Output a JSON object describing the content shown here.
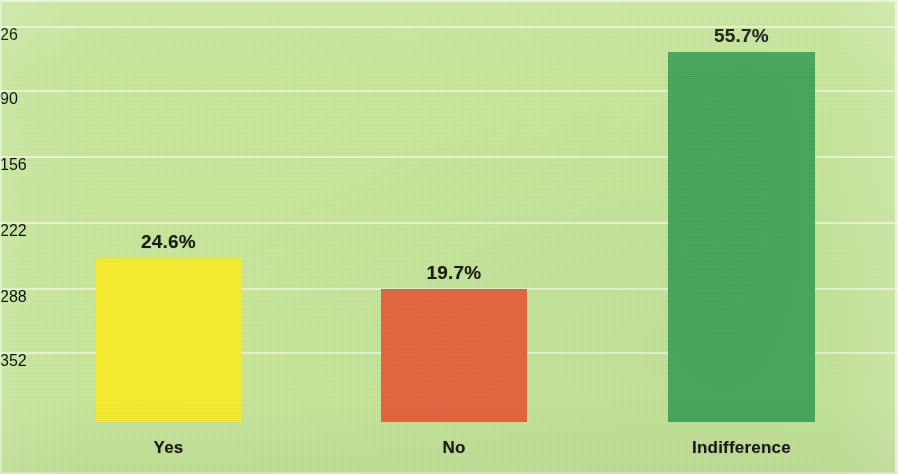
{
  "chart_data": {
    "type": "bar",
    "title": "",
    "subtitle": "",
    "xlabel": "",
    "ylabel": "",
    "categories": [
      "Yes",
      "No",
      "Indifference"
    ],
    "values": [
      24.6,
      19.7,
      55.7
    ],
    "value_labels": [
      "24.6%",
      "19.7%",
      "55.7%"
    ],
    "series": [
      {
        "name": "",
        "values": [
          24.6,
          19.7,
          55.7
        ]
      }
    ],
    "bar_colors": [
      "#f8ee2e",
      "#e8663f",
      "#48a85c"
    ],
    "ylim": [
      0,
      70
    ],
    "grid": true,
    "gridlines_horizontal": 6,
    "legend": "none",
    "legend_position": "none",
    "background_color": "#c8e89c",
    "label_color": "#1a1a16",
    "units": "percent"
  },
  "bars": [
    {
      "category": "Yes",
      "value_label": "24.6%",
      "color": "#f8ee2e",
      "left": 96,
      "width": 145,
      "top": 258,
      "height": 164
    },
    {
      "category": "No",
      "value_label": "19.7%",
      "color": "#e8663f",
      "left": 381,
      "width": 146,
      "top": 289,
      "height": 133
    },
    {
      "category": "Indifference",
      "value_label": "55.7%",
      "color": "#48a85c",
      "left": 668,
      "width": 147,
      "top": 52,
      "height": 370
    }
  ],
  "gridlines": [
    26,
    90,
    156,
    222,
    288,
    352
  ]
}
